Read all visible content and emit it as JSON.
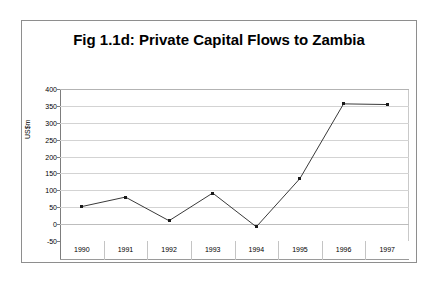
{
  "chart_data": {
    "type": "line",
    "title": "Fig 1.1d: Private Capital Flows to Zambia",
    "xlabel": "",
    "ylabel": "US$m",
    "categories": [
      "1990",
      "1991",
      "1992",
      "1993",
      "1994",
      "1995",
      "1996",
      "1997"
    ],
    "values": [
      52,
      80,
      10,
      92,
      -8,
      135,
      356,
      354
    ],
    "series": [
      {
        "name": "Private Capital Flows",
        "values": [
          52,
          80,
          10,
          92,
          -8,
          135,
          356,
          354
        ]
      }
    ],
    "ylim": [
      -50,
      400
    ],
    "yticks": [
      400,
      350,
      300,
      250,
      200,
      150,
      100,
      50,
      0,
      -50
    ],
    "ytick_labels": [
      "400",
      "350",
      "300",
      "250",
      "200",
      "150",
      "100",
      "50",
      "0",
      "-50"
    ],
    "grid": true,
    "legend": "none",
    "marker": "square",
    "line_color": "#3a3a3a",
    "marker_color": "#1a1a1a",
    "grid_color": "#d3d3d3",
    "axis_color": "#7d7d7d",
    "border_color": "#8e8e8e",
    "plot_background": "#ffffff"
  }
}
